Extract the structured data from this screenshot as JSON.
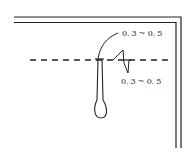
{
  "diagram": {
    "type": "technical-sketch",
    "colors": {
      "line": "#222222",
      "background": "#ffffff"
    },
    "labels": {
      "top_dimension": "0. 3 ~ 0. 5",
      "bottom_dimension": "0. 3 ~ 0. 5"
    }
  }
}
